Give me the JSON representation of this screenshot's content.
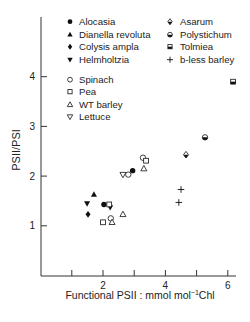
{
  "chart_data": {
    "type": "scatter",
    "title": "",
    "xlabel": "Functional PSII : mmol mol⁻¹Chl",
    "ylabel": "PSII/PSI",
    "xlim": [
      0,
      6.2
    ],
    "ylim": [
      0,
      5.2
    ],
    "x_ticks": [
      1,
      2,
      3,
      4,
      5,
      6
    ],
    "x_tick_labels": [
      "",
      "2",
      "",
      "4",
      "",
      "6"
    ],
    "y_ticks": [
      1,
      2,
      3,
      4
    ],
    "y_tick_labels": [
      "1",
      "2",
      "3",
      "4"
    ],
    "grid": false,
    "legend_position": "upper-left (inside)",
    "series": [
      {
        "name": "Alocasia",
        "marker": "filled-circle",
        "points": [
          [
            2.03,
            1.43
          ],
          [
            2.95,
            2.11
          ]
        ]
      },
      {
        "name": "Dianella revoluta",
        "marker": "filled-triangle-up",
        "points": [
          [
            1.71,
            1.63
          ]
        ]
      },
      {
        "name": "Colysis ampla",
        "marker": "filled-diamond",
        "points": [
          [
            1.52,
            1.23
          ]
        ]
      },
      {
        "name": "Helmholtzia",
        "marker": "filled-triangle-down",
        "points": [
          [
            1.49,
            1.45
          ],
          [
            2.23,
            1.37
          ]
        ]
      },
      {
        "name": "Spinach",
        "marker": "open-circle",
        "points": [
          [
            2.25,
            1.15
          ],
          [
            2.81,
            2.03
          ],
          [
            3.28,
            2.37
          ]
        ]
      },
      {
        "name": "Pea",
        "marker": "open-square",
        "points": [
          [
            2.0,
            1.07
          ],
          [
            2.2,
            1.43
          ],
          [
            3.38,
            2.31
          ]
        ]
      },
      {
        "name": "WT barley",
        "marker": "open-triangle-up",
        "points": [
          [
            2.29,
            1.07
          ],
          [
            2.64,
            1.23
          ],
          [
            3.31,
            2.15
          ]
        ]
      },
      {
        "name": "Lettuce",
        "marker": "open-triangle-down",
        "points": [
          [
            2.64,
            2.03
          ]
        ]
      },
      {
        "name": "Asarum",
        "marker": "half-filled-diamond",
        "points": [
          [
            4.66,
            2.43
          ]
        ]
      },
      {
        "name": "Polystichum",
        "marker": "half-filled-circle",
        "points": [
          [
            5.27,
            2.78
          ]
        ]
      },
      {
        "name": "Tolmiea",
        "marker": "half-filled-square",
        "points": [
          [
            6.17,
            3.9
          ]
        ]
      },
      {
        "name": "b-less barley",
        "marker": "plus",
        "points": [
          [
            4.5,
            1.73
          ],
          [
            4.43,
            1.47
          ]
        ]
      }
    ]
  },
  "legend": {
    "group1_col1": [
      "Alocasia",
      "Dianella revoluta",
      "Colysis ampla",
      "Helmholtzia"
    ],
    "group1_col2": [
      "Asarum",
      "Polystichum",
      "Tolmiea",
      "b-less barley"
    ],
    "group2": [
      "Spinach",
      "Pea",
      "WT barley",
      "Lettuce"
    ]
  },
  "axes": {
    "ylabel": "PSII/PSI",
    "xlabel_main": "Functional PSII : mmol mol",
    "xlabel_sup": "−1",
    "xlabel_tail": "Chl",
    "x_tick_labels": [
      "2",
      "4",
      "6"
    ],
    "y_tick_labels": [
      "1",
      "2",
      "3",
      "4"
    ]
  }
}
